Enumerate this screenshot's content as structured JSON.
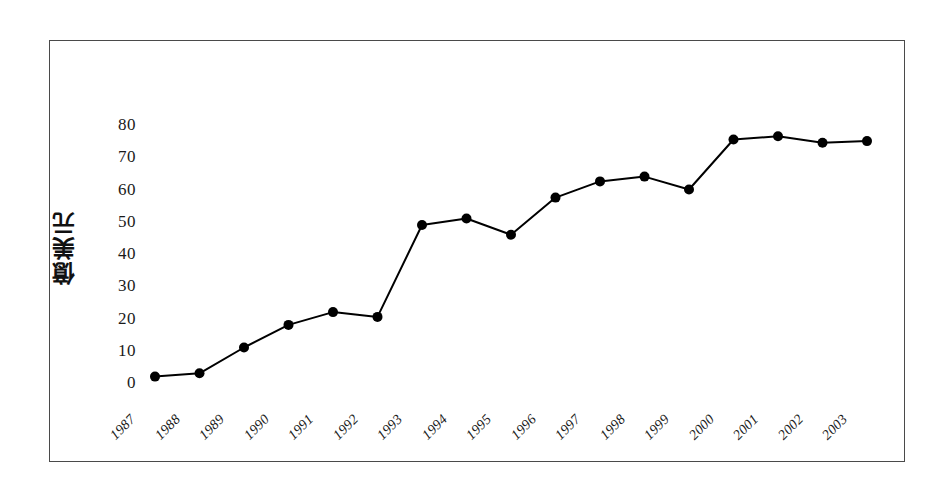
{
  "figure": {
    "frame_color": "#4a4a4a",
    "background_color": "#ffffff",
    "series_color": "#000000"
  },
  "axis": {
    "y_title": "億美元",
    "y_tick_labels": [
      "80",
      "70",
      "60",
      "50",
      "40",
      "30",
      "20",
      "10",
      "0"
    ],
    "x_tick_labels": [
      "1987",
      "1988",
      "1989",
      "1990",
      "1991",
      "1992",
      "1993",
      "1994",
      "1995",
      "1996",
      "1997",
      "1998",
      "1999",
      "2000",
      "2001",
      "2002",
      "2003"
    ]
  },
  "chart_data": {
    "type": "line",
    "title": "",
    "subtitle": "",
    "xlabel": "",
    "ylabel": "億美元",
    "categories": [
      "1987",
      "1988",
      "1989",
      "1990",
      "1991",
      "1992",
      "1993",
      "1994",
      "1995",
      "1996",
      "1997",
      "1998",
      "1999",
      "2000",
      "2001",
      "2002",
      "2003"
    ],
    "values": [
      2,
      3,
      11,
      18,
      22,
      20.5,
      49,
      51,
      46,
      57.5,
      62.5,
      64,
      60,
      75.5,
      76.5,
      74.5,
      75
    ],
    "series": [
      {
        "name": "億美元",
        "values": [
          2,
          3,
          11,
          18,
          22,
          20.5,
          49,
          51,
          46,
          57.5,
          62.5,
          64,
          60,
          75.5,
          76.5,
          74.5,
          75
        ]
      }
    ],
    "ylim": [
      0,
      80
    ],
    "y_ticks": [
      0,
      10,
      20,
      30,
      40,
      50,
      60,
      70,
      80
    ],
    "grid": false,
    "legend": "none",
    "marker": "filled-circle",
    "line_width": 2,
    "marker_size": 10
  }
}
